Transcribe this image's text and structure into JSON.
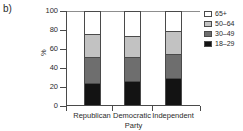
{
  "panel": {
    "label": "b)"
  },
  "chart_data": {
    "type": "bar",
    "subtype": "stacked-bar-100",
    "title": "",
    "xlabel": "Party",
    "ylabel": "%",
    "ylim": [
      0,
      100
    ],
    "yticks": [
      0,
      20,
      40,
      60,
      80,
      100
    ],
    "grid": false,
    "legend_position": "right",
    "categories": [
      "Republican",
      "Democratic",
      "Independent"
    ],
    "series": [
      {
        "name": "18–29",
        "color": "#131313",
        "values": [
          23,
          25,
          28
        ]
      },
      {
        "name": "30–49",
        "color": "#6e6e6e",
        "values": [
          28,
          26,
          26
        ]
      },
      {
        "name": "50–64",
        "color": "#c2c2c2",
        "values": [
          24,
          22,
          24
        ]
      },
      {
        "name": "65+",
        "color": "#ffffff",
        "values": [
          25,
          27,
          22
        ]
      }
    ],
    "legend_order": [
      "65+",
      "50–64",
      "30–49",
      "18–29"
    ],
    "cumulative_tops": {
      "Republican": {
        "18–29": 23,
        "30–49": 51,
        "50–64": 75,
        "65+": 100
      },
      "Democratic": {
        "18–29": 25,
        "30–49": 51,
        "50–64": 73,
        "65+": 100
      },
      "Independent": {
        "18–29": 28,
        "30–49": 54,
        "50–64": 78,
        "65+": 100
      }
    }
  },
  "axis": {
    "y_tick_labels": [
      "100",
      "80",
      "60",
      "40",
      "20",
      "0"
    ],
    "y_title": "%",
    "x_title": "Party",
    "x_tick_labels": [
      "Republican",
      "Democratic",
      "Independent"
    ]
  },
  "legend": {
    "items": [
      {
        "label": "65+",
        "color": "#ffffff"
      },
      {
        "label": "50–64",
        "color": "#c2c2c2"
      },
      {
        "label": "30–49",
        "color": "#6e6e6e"
      },
      {
        "label": "18–29",
        "color": "#131313"
      }
    ]
  },
  "colors": {
    "axis": "#4a4a4a",
    "text": "#2b2b2b",
    "background": "#ffffff"
  }
}
